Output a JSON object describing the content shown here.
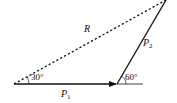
{
  "diagram": {
    "type": "vector-triangle",
    "colors": {
      "line": "#111111",
      "background": "#ffffff"
    },
    "vectors": {
      "P1": {
        "label": "P",
        "subscript": "1",
        "style": "solid-arrow"
      },
      "P2": {
        "label": "P",
        "subscript": "2",
        "style": "solid"
      },
      "R": {
        "label": "R",
        "style": "dashed"
      }
    },
    "angles": {
      "between_R_and_P1": "30°",
      "between_P2_and_horizontal": "60°"
    }
  }
}
